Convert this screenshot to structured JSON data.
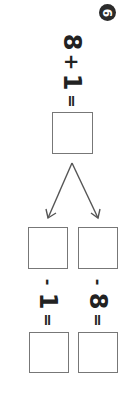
{
  "problem": {
    "number": "6",
    "top_equation": {
      "a": "8",
      "op": "+",
      "b": "1",
      "eq": "="
    },
    "branches": [
      {
        "op": "-",
        "operand": "1",
        "eq": "="
      },
      {
        "op": "-",
        "operand": "8",
        "eq": "="
      }
    ]
  },
  "colors": {
    "badge": "#2b2b2b",
    "box_border": "#777777",
    "text": "#222222"
  }
}
